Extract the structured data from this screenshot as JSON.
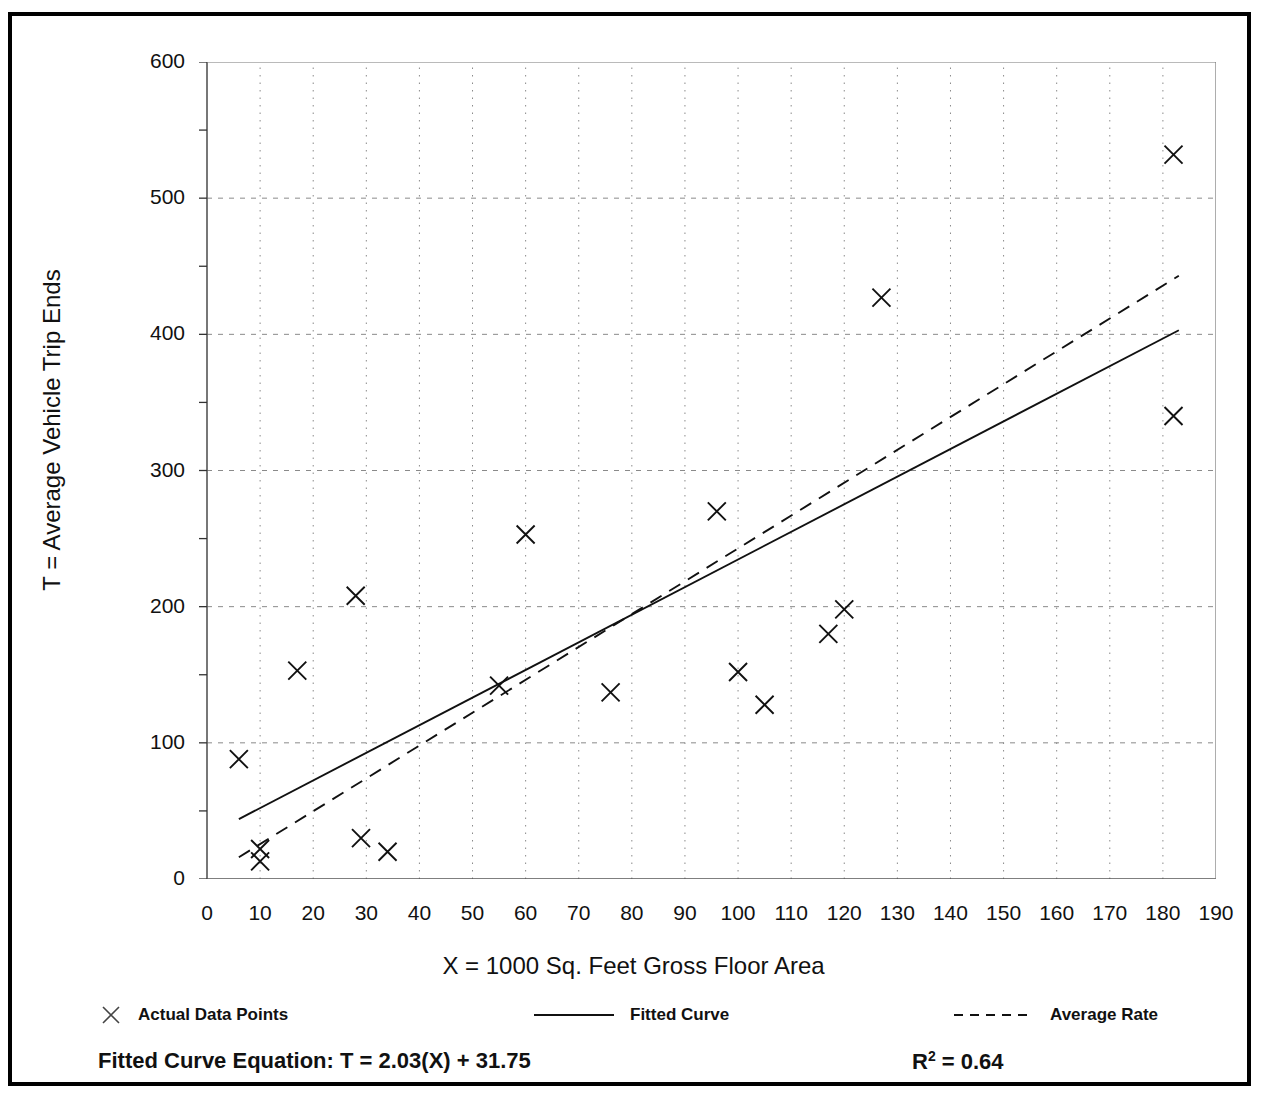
{
  "chart_data": {
    "type": "scatter",
    "title": "",
    "xlabel": "X = 1000 Sq. Feet Gross Floor Area",
    "ylabel": "T = Average Vehicle Trip Ends",
    "xlim": [
      0,
      190
    ],
    "ylim": [
      0,
      600
    ],
    "xticks": [
      0,
      10,
      20,
      30,
      40,
      50,
      60,
      70,
      80,
      90,
      100,
      110,
      120,
      130,
      140,
      150,
      160,
      170,
      180,
      190
    ],
    "yticks": [
      0,
      100,
      200,
      300,
      400,
      500,
      600
    ],
    "x_minor_tick_step": 5,
    "y_minor_tick_step": 50,
    "grid": "dotted vertical every 10 units, dotted horizontal every 100 units",
    "legend_position": "below plot",
    "series": [
      {
        "name": "Actual Data Points",
        "type": "scatter",
        "marker": "x",
        "points": [
          [
            6,
            88
          ],
          [
            10,
            22
          ],
          [
            10,
            13
          ],
          [
            17,
            153
          ],
          [
            28,
            208
          ],
          [
            29,
            30
          ],
          [
            34,
            20
          ],
          [
            55,
            142
          ],
          [
            60,
            253
          ],
          [
            76,
            137
          ],
          [
            96,
            270
          ],
          [
            100,
            152
          ],
          [
            105,
            128
          ],
          [
            117,
            180
          ],
          [
            120,
            198
          ],
          [
            127,
            427
          ],
          [
            182,
            532
          ],
          [
            182,
            340
          ]
        ]
      },
      {
        "name": "Fitted Curve",
        "type": "line",
        "style": "solid",
        "equation": "T = 2.03(X) + 31.75",
        "endpoints": [
          [
            6,
            44
          ],
          [
            183,
            403
          ]
        ]
      },
      {
        "name": "Average Rate",
        "type": "line",
        "style": "dashed",
        "endpoints": [
          [
            6,
            16
          ],
          [
            183,
            443
          ]
        ]
      }
    ]
  },
  "axes": {
    "y_title": "T = Average Vehicle Trip Ends",
    "x_title": "X = 1000 Sq. Feet Gross Floor Area",
    "y_tick_labels": [
      "600",
      "500",
      "400",
      "300",
      "200",
      "100",
      "0"
    ],
    "x_tick_labels": [
      "0",
      "10",
      "20",
      "30",
      "40",
      "50",
      "60",
      "70",
      "80",
      "90",
      "100",
      "110",
      "120",
      "130",
      "140",
      "150",
      "160",
      "170",
      "180",
      "190"
    ]
  },
  "legend": {
    "items": [
      {
        "label": "Actual Data Points",
        "marker": "x-marker"
      },
      {
        "label": "Fitted Curve",
        "marker": "solid-line"
      },
      {
        "label": "Average Rate",
        "marker": "dashed-line"
      }
    ]
  },
  "footer": {
    "equation_label": "Fitted Curve Equation:  T = 2.03(X) + 31.75",
    "r_squared_prefix": "R",
    "r_squared_exponent": "2",
    "r_squared_value": " = 0.64"
  },
  "colors": {
    "ink": "#111111",
    "grid": "#8a8a8a",
    "frame": "#000000",
    "background": "#ffffff"
  }
}
